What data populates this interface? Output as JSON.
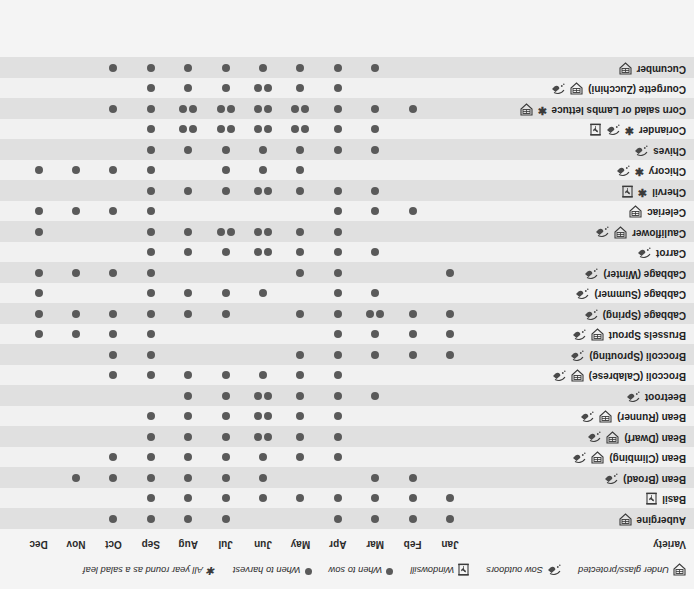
{
  "chart_data": {
    "type": "table",
    "xlabel": "",
    "ylabel": "Variety",
    "grid": true,
    "legend_position": "top",
    "columns_header": "Variety",
    "categories": [
      "Jan",
      "Feb",
      "Mar",
      "Apr",
      "May",
      "Jun",
      "Jul",
      "Aug",
      "Sep",
      "Oct",
      "Nov",
      "Dec"
    ],
    "legend": [
      {
        "key": "under-glass",
        "icon": "under-glass-icon",
        "label": "Under glass/protected"
      },
      {
        "key": "sow-outdoors",
        "icon": "sow-outdoors-icon",
        "label": "Sow outdoors"
      },
      {
        "key": "windowsill",
        "icon": "windowsill-icon",
        "label": "Windowsill"
      },
      {
        "key": "sow",
        "icon": "dot-icon",
        "label": "When to sow"
      },
      {
        "key": "harvest",
        "icon": "dot-icon",
        "label": "When to harvest"
      },
      {
        "key": "salad-leaf",
        "icon": "star-icon",
        "label": "All year round as a salad leaf"
      }
    ],
    "rows": [
      {
        "variety": "Aubergine",
        "star": false,
        "icons": [
          "under-glass"
        ],
        "sow": [
          "Jan",
          "Feb",
          "Mar",
          "Apr"
        ],
        "harvest": [
          "Jul",
          "Aug",
          "Sep",
          "Oct"
        ]
      },
      {
        "variety": "Basil",
        "star": false,
        "icons": [
          "windowsill"
        ],
        "sow": [
          "Jan",
          "Feb",
          "Mar",
          "Apr",
          "May"
        ],
        "harvest": [
          "Jun",
          "Jul",
          "Aug",
          "Sep"
        ]
      },
      {
        "variety": "Bean (Broad)",
        "star": false,
        "icons": [
          "sow-outdoors"
        ],
        "sow": [
          "Feb",
          "Mar"
        ],
        "harvest": [
          "Jun",
          "Jul",
          "Aug",
          "Sep",
          "Oct",
          "Nov"
        ]
      },
      {
        "variety": "Bean (Climbing)",
        "star": false,
        "icons": [
          "under-glass",
          "sow-outdoors"
        ],
        "sow": [
          "Apr",
          "May",
          "Jun"
        ],
        "harvest": [
          "Jul",
          "Aug",
          "Sep",
          "Oct"
        ]
      },
      {
        "variety": "Bean (Dwarf)",
        "star": false,
        "icons": [
          "under-glass",
          "sow-outdoors"
        ],
        "sow": [
          "Apr",
          "May",
          "Jun"
        ],
        "harvest": [
          "Jun",
          "Jul",
          "Aug",
          "Sep"
        ]
      },
      {
        "variety": "Bean (Runner)",
        "star": false,
        "icons": [
          "under-glass",
          "sow-outdoors"
        ],
        "sow": [
          "Apr",
          "May",
          "Jun"
        ],
        "harvest": [
          "Jun",
          "Jul",
          "Aug",
          "Sep"
        ]
      },
      {
        "variety": "Beetroot",
        "star": false,
        "icons": [
          "sow-outdoors"
        ],
        "sow": [
          "Mar",
          "Apr",
          "May",
          "Jun"
        ],
        "harvest": [
          "Jun",
          "Jul",
          "Aug"
        ]
      },
      {
        "variety": "Broccoli (Calabrese)",
        "star": false,
        "icons": [
          "under-glass",
          "sow-outdoors"
        ],
        "sow": [
          "Apr",
          "May",
          "Jun",
          "Jul"
        ],
        "harvest": [
          "Aug",
          "Sep",
          "Oct"
        ]
      },
      {
        "variety": "Broccoli (Sprouting)",
        "star": false,
        "icons": [
          "sow-outdoors"
        ],
        "sow": [
          "Apr",
          "May"
        ],
        "harvest": [
          "Jan",
          "Feb",
          "Mar",
          "Sep",
          "Oct"
        ]
      },
      {
        "variety": "Brussels Sprout",
        "star": false,
        "icons": [
          "under-glass",
          "sow-outdoors"
        ],
        "sow": [
          "Feb",
          "Mar",
          "Apr"
        ],
        "harvest": [
          "Jan",
          "Sep",
          "Oct",
          "Nov",
          "Dec"
        ]
      },
      {
        "variety": "Cabbage (Spring)",
        "star": false,
        "icons": [
          "sow-outdoors"
        ],
        "sow": [
          "Jan",
          "Feb",
          "Mar",
          "Jul",
          "Aug"
        ],
        "harvest": [
          "Mar",
          "Apr",
          "May",
          "Sep",
          "Oct",
          "Nov",
          "Dec"
        ]
      },
      {
        "variety": "Cabbage (Summer)",
        "star": false,
        "icons": [
          "sow-outdoors"
        ],
        "sow": [
          "Mar",
          "Apr"
        ],
        "harvest": [
          "Jun",
          "Jul",
          "Aug",
          "Sep",
          "Dec"
        ]
      },
      {
        "variety": "Cabbage (Winter)",
        "star": false,
        "icons": [
          "sow-outdoors"
        ],
        "sow": [
          "Jan",
          "Apr",
          "May"
        ],
        "harvest": [
          "Sep",
          "Oct",
          "Nov",
          "Dec"
        ]
      },
      {
        "variety": "Carrot",
        "star": false,
        "icons": [
          "sow-outdoors"
        ],
        "sow": [
          "Mar",
          "Apr",
          "May",
          "Jun"
        ],
        "harvest": [
          "Jun",
          "Jul",
          "Aug",
          "Sep"
        ]
      },
      {
        "variety": "Cauliflower",
        "star": false,
        "icons": [
          "under-glass",
          "sow-outdoors"
        ],
        "sow": [
          "Apr",
          "May",
          "Jun",
          "Jul"
        ],
        "harvest": [
          "Jun",
          "Jul",
          "Aug",
          "Sep",
          "Dec"
        ]
      },
      {
        "variety": "Celeriac",
        "star": false,
        "icons": [
          "under-glass"
        ],
        "sow": [
          "Feb",
          "Mar",
          "Apr"
        ],
        "harvest": [
          "Sep",
          "Oct",
          "Nov",
          "Dec"
        ]
      },
      {
        "variety": "Chervil",
        "star": true,
        "icons": [
          "windowsill"
        ],
        "sow": [
          "Mar",
          "Apr",
          "May",
          "Jun"
        ],
        "harvest": [
          "Jun",
          "Jul",
          "Aug",
          "Sep"
        ]
      },
      {
        "variety": "Chicory",
        "star": true,
        "icons": [
          "sow-outdoors"
        ],
        "sow": [
          "May",
          "Jun",
          "Jul"
        ],
        "harvest": [
          "Sep",
          "Oct",
          "Nov",
          "Dec"
        ]
      },
      {
        "variety": "Chives",
        "star": false,
        "icons": [
          "sow-outdoors"
        ],
        "sow": [
          "Mar",
          "Apr",
          "May"
        ],
        "harvest": [
          "Jun",
          "Jul",
          "Aug",
          "Sep"
        ]
      },
      {
        "variety": "Coriander",
        "star": true,
        "icons": [
          "sow-outdoors",
          "windowsill"
        ],
        "sow": [
          "Mar",
          "Apr",
          "May",
          "Jun",
          "Jul",
          "Aug"
        ],
        "harvest": [
          "May",
          "Jun",
          "Jul",
          "Aug",
          "Sep"
        ]
      },
      {
        "variety": "Corn salad or Lambs lettuce",
        "star": true,
        "icons": [
          "under-glass"
        ],
        "sow": [
          "Feb",
          "Mar",
          "Apr",
          "May",
          "Jun",
          "Jul",
          "Aug"
        ],
        "harvest": [
          "May",
          "Jun",
          "Jul",
          "Aug",
          "Sep",
          "Oct"
        ]
      },
      {
        "variety": "Courgette (Zucchini)",
        "star": false,
        "icons": [
          "under-glass",
          "sow-outdoors"
        ],
        "sow": [
          "Apr",
          "May",
          "Jun"
        ],
        "harvest": [
          "Jun",
          "Jul",
          "Aug",
          "Sep"
        ]
      },
      {
        "variety": "Cucumber",
        "star": false,
        "icons": [
          "under-glass"
        ],
        "sow": [
          "Mar",
          "Apr",
          "May"
        ],
        "harvest": [
          "Jun",
          "Jul",
          "Aug",
          "Sep",
          "Oct"
        ]
      }
    ]
  },
  "layout": {
    "first_month_x": 244,
    "month_spacing": 37.4,
    "row_height": 20.5,
    "name_right_edge": 688,
    "dot_pair_offset": 5
  },
  "colors": {
    "dot": "#5a5a5a",
    "row_alt": "#e0e0e0",
    "row_plain": "#f1f1f1",
    "text": "#222222",
    "background": "#f4f4f4"
  }
}
